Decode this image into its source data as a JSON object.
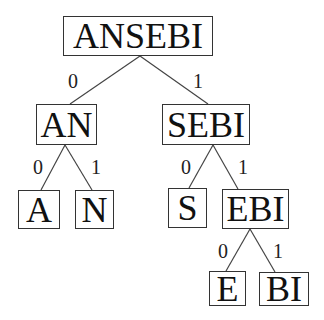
{
  "diagram": {
    "type": "binary-tree",
    "nodes": {
      "root": "ANSEBI",
      "l": "AN",
      "r": "SEBI",
      "ll": "A",
      "lr": "N",
      "rl": "S",
      "rr": "EBI",
      "rrl": "E",
      "rrr": "BI"
    },
    "edge_labels": {
      "root_l": "0",
      "root_r": "1",
      "l_l": "0",
      "l_r": "1",
      "r_l": "0",
      "r_r": "1",
      "rr_l": "0",
      "rr_r": "1"
    }
  }
}
